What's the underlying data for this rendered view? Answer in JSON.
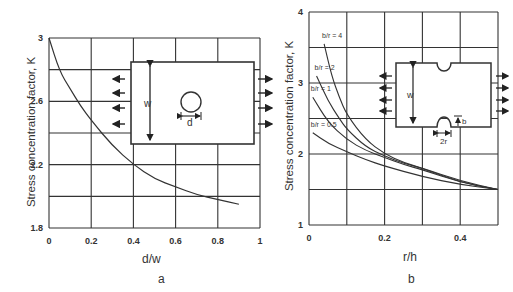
{
  "chart_data": [
    {
      "id": "a",
      "type": "line",
      "caption": "a",
      "title": "",
      "xlabel": "d/w",
      "ylabel": "Stress concentration factor, K",
      "xlim": [
        0,
        1
      ],
      "ylim": [
        1.8,
        3
      ],
      "xticks": [
        "0",
        "0.2",
        "0.4",
        "0.6",
        "0.8",
        "1"
      ],
      "yticks": [
        "1.8",
        "2.2",
        "2.6",
        "3"
      ],
      "grid": true,
      "series": [
        {
          "name": "K vs d/w",
          "x": [
            0,
            0.05,
            0.1,
            0.15,
            0.2,
            0.3,
            0.4,
            0.5,
            0.6,
            0.7,
            0.8,
            0.9
          ],
          "values": [
            3.0,
            2.79,
            2.68,
            2.57,
            2.48,
            2.32,
            2.2,
            2.11,
            2.06,
            2.01,
            1.98,
            1.95
          ]
        }
      ],
      "inset": {
        "shape": "plate with central circular hole",
        "labels": [
          "w",
          "d"
        ]
      }
    },
    {
      "id": "b",
      "type": "line",
      "caption": "b",
      "title": "",
      "xlabel": "r/h",
      "ylabel": "Stress concentration factor, K",
      "xlim": [
        0,
        0.5
      ],
      "ylim": [
        1,
        4
      ],
      "xticks": [
        "0",
        "0.2",
        "0.4"
      ],
      "yticks": [
        "1",
        "2",
        "3",
        "4"
      ],
      "grid": true,
      "series": [
        {
          "name": "b/r = 4",
          "x": [
            0.04,
            0.06,
            0.08,
            0.1,
            0.15,
            0.2,
            0.25,
            0.3,
            0.4,
            0.5
          ],
          "values": [
            3.55,
            3.1,
            2.8,
            2.55,
            2.2,
            2.0,
            1.88,
            1.8,
            1.62,
            1.5
          ]
        },
        {
          "name": "b/r = 2",
          "x": [
            0.02,
            0.05,
            0.08,
            0.1,
            0.15,
            0.2,
            0.25,
            0.3,
            0.4,
            0.5
          ],
          "values": [
            3.1,
            2.75,
            2.5,
            2.35,
            2.1,
            1.97,
            1.87,
            1.8,
            1.6,
            1.5
          ]
        },
        {
          "name": "b/r = 1",
          "x": [
            0.01,
            0.05,
            0.1,
            0.15,
            0.2,
            0.25,
            0.3,
            0.4,
            0.5
          ],
          "values": [
            2.8,
            2.45,
            2.2,
            2.05,
            1.95,
            1.85,
            1.78,
            1.6,
            1.5
          ]
        },
        {
          "name": "b/r = 0.5",
          "x": [
            0.01,
            0.05,
            0.1,
            0.15,
            0.2,
            0.3,
            0.4,
            0.5
          ],
          "values": [
            2.3,
            2.15,
            2.03,
            1.92,
            1.83,
            1.68,
            1.57,
            1.5
          ]
        }
      ],
      "inset": {
        "shape": "plate with two semicircular edge notches",
        "labels": [
          "w",
          "2r",
          "b"
        ]
      }
    }
  ]
}
